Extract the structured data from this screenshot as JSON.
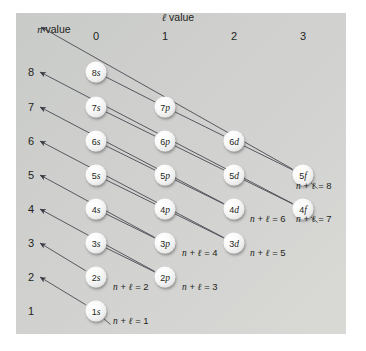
{
  "figure": {
    "background_color": "#ffffff",
    "panel_color": "#d2d3d0",
    "ink_color": "#231f20",
    "orbital_fill": "#f2f2f2"
  },
  "axes": {
    "column_axis_title_prefix": "ℓ",
    "column_axis_title_suffix": " value",
    "row_axis_title_prefix": "n",
    "row_axis_title_suffix": " value",
    "column_headers": [
      "0",
      "1",
      "2",
      "3"
    ],
    "row_headers": [
      "8",
      "7",
      "6",
      "5",
      "4",
      "3",
      "2",
      "1"
    ]
  },
  "orbitals": [
    {
      "label": "8s",
      "n": "8",
      "sub": "s",
      "col": 0,
      "row": 8
    },
    {
      "label": "7s",
      "n": "7",
      "sub": "s",
      "col": 0,
      "row": 7
    },
    {
      "label": "7p",
      "n": "7",
      "sub": "p",
      "col": 1,
      "row": 7
    },
    {
      "label": "6s",
      "n": "6",
      "sub": "s",
      "col": 0,
      "row": 6
    },
    {
      "label": "6p",
      "n": "6",
      "sub": "p",
      "col": 1,
      "row": 6
    },
    {
      "label": "6d",
      "n": "6",
      "sub": "d",
      "col": 2,
      "row": 6
    },
    {
      "label": "5s",
      "n": "5",
      "sub": "s",
      "col": 0,
      "row": 5
    },
    {
      "label": "5p",
      "n": "5",
      "sub": "p",
      "col": 1,
      "row": 5
    },
    {
      "label": "5d",
      "n": "5",
      "sub": "d",
      "col": 2,
      "row": 5
    },
    {
      "label": "5f",
      "n": "5",
      "sub": "f",
      "col": 3,
      "row": 5
    },
    {
      "label": "4s",
      "n": "4",
      "sub": "s",
      "col": 0,
      "row": 4
    },
    {
      "label": "4p",
      "n": "4",
      "sub": "p",
      "col": 1,
      "row": 4
    },
    {
      "label": "4d",
      "n": "4",
      "sub": "d",
      "col": 2,
      "row": 4
    },
    {
      "label": "4f",
      "n": "4",
      "sub": "f",
      "col": 3,
      "row": 4
    },
    {
      "label": "3s",
      "n": "3",
      "sub": "s",
      "col": 0,
      "row": 3
    },
    {
      "label": "3p",
      "n": "3",
      "sub": "p",
      "col": 1,
      "row": 3
    },
    {
      "label": "3d",
      "n": "3",
      "sub": "d",
      "col": 2,
      "row": 3
    },
    {
      "label": "2s",
      "n": "2",
      "sub": "s",
      "col": 0,
      "row": 2
    },
    {
      "label": "2p",
      "n": "2",
      "sub": "p",
      "col": 1,
      "row": 2
    },
    {
      "label": "1s",
      "n": "1",
      "sub": "s",
      "col": 0,
      "row": 1
    }
  ],
  "diagonals": [
    {
      "sum": "1",
      "label": "n + ℓ = 1",
      "start_orbital": "1s",
      "end_target": "row-2-arrowhead"
    },
    {
      "sum": "2",
      "label": "n + ℓ = 2",
      "start_orbital": "2s",
      "end_target": "row-3-arrowhead"
    },
    {
      "sum": "3",
      "label": "n + ℓ = 3",
      "start_orbital": "2p",
      "end_target": "row-4-arrowhead"
    },
    {
      "sum": "4",
      "label": "n + ℓ = 4",
      "start_orbital": "3p",
      "end_target": "row-5-arrowhead"
    },
    {
      "sum": "5",
      "label": "n + ℓ = 5",
      "start_orbital": "3d",
      "end_target": "row-6-arrowhead"
    },
    {
      "sum": "6",
      "label": "n + ℓ = 6",
      "start_orbital": "4d",
      "end_target": "row-7-arrowhead"
    },
    {
      "sum": "7",
      "label": "n + ℓ = 7",
      "start_orbital": "4f",
      "end_target": "row-8-arrowhead"
    },
    {
      "sum": "8",
      "label": "n + ℓ = 8",
      "start_orbital": "5f",
      "end_target": "n-value-arrowhead"
    }
  ],
  "nl_labels": [
    {
      "text": "n + ℓ = 1",
      "x": 113,
      "y": 321
    },
    {
      "text": "n + ℓ = 2",
      "x": 113,
      "y": 287
    },
    {
      "text": "n + ℓ = 3",
      "x": 182,
      "y": 287
    },
    {
      "text": "n + ℓ = 4",
      "x": 182,
      "y": 253
    },
    {
      "text": "n + ℓ = 5",
      "x": 250,
      "y": 253
    },
    {
      "text": "n + ℓ = 6",
      "x": 250,
      "y": 219
    },
    {
      "text": "n + ℓ = 7",
      "x": 296,
      "y": 219
    },
    {
      "text": "n + ℓ = 8",
      "x": 296,
      "y": 186
    }
  ],
  "geometry": {
    "col_x": [
      96,
      165,
      234,
      303
    ],
    "row_y": [
      311,
      277,
      243,
      209,
      175,
      141,
      107,
      72
    ],
    "row_label_x": 31,
    "col_header_y": 36,
    "l_value_title_x": 178,
    "l_value_title_y": 18,
    "n_value_title_x": 54,
    "n_value_title_y": 30,
    "orbital_radius": 10.5
  }
}
